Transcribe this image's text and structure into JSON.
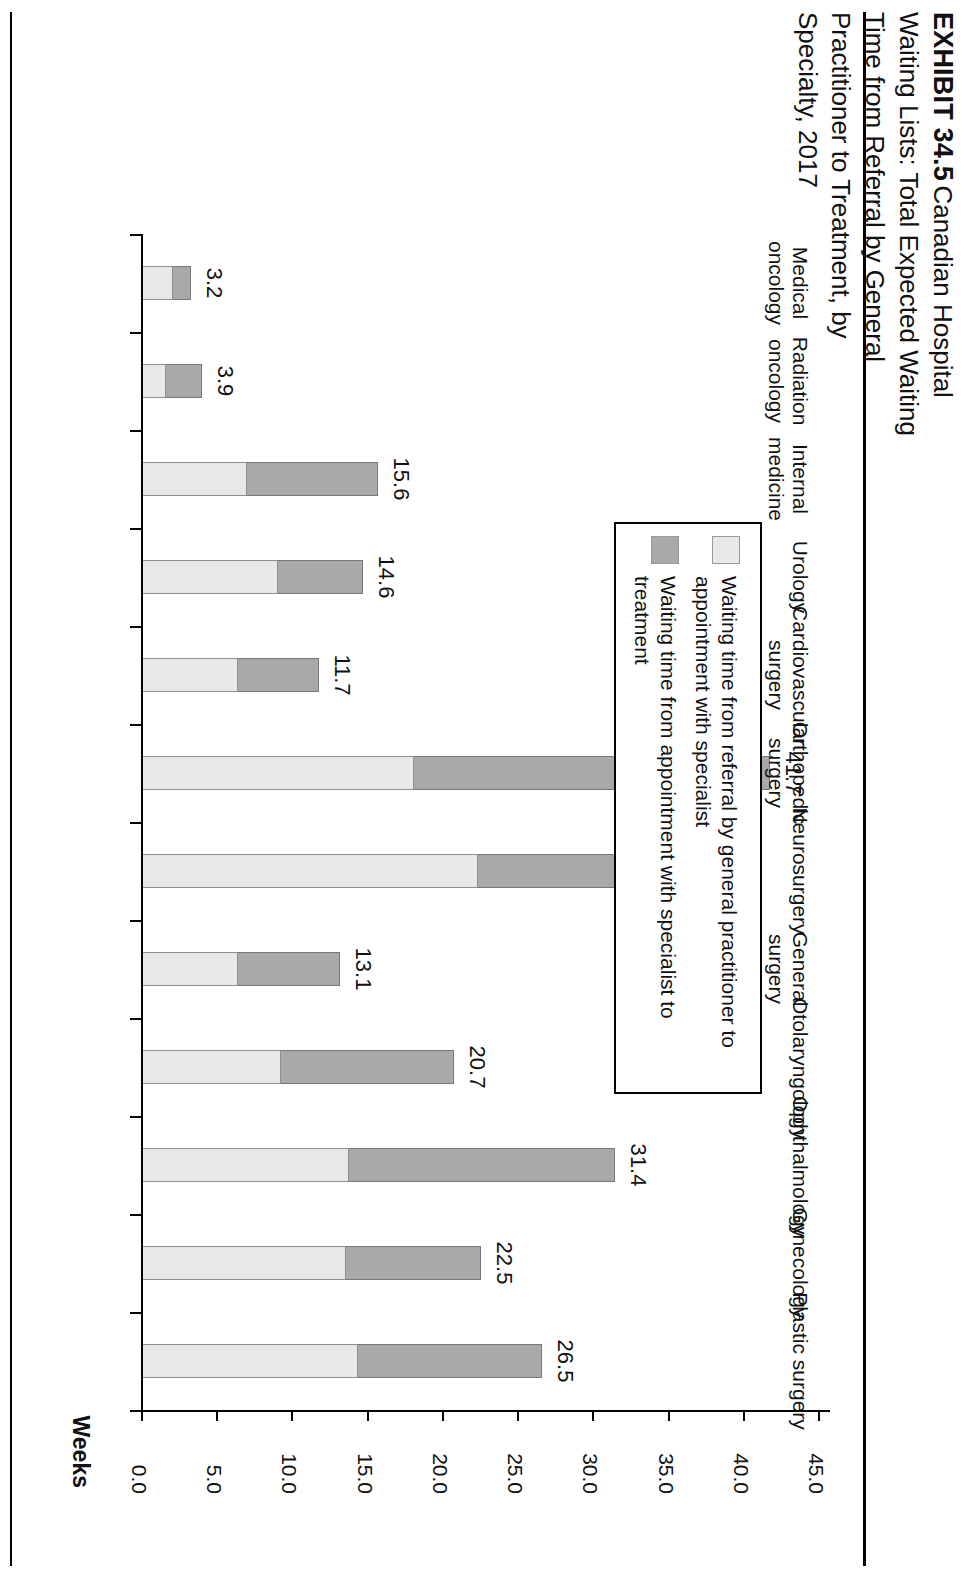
{
  "exhibit": {
    "number_label": "EXHIBIT 34.5",
    "title_lines": [
      "Canadian",
      "Hospital",
      "Waiting Lists:",
      "Total Expected",
      "Waiting Time",
      "from Referral",
      "by General",
      "Practitioner to",
      "Treatment, by",
      "Specialty, 2017"
    ],
    "title_full": "EXHIBIT 34.5 Canadian Hospital Waiting Lists: Total Expected Waiting Time from Referral by General Practitioner to Treatment, by Specialty, 2017"
  },
  "legend": {
    "position": "top-left",
    "items": [
      {
        "label": "Waiting time from referral by general practitioner to appointment with specialist",
        "color": "#e9e9e9",
        "swatch_name": "legend-swatch-gp-to-specialist"
      },
      {
        "label": "Waiting time from appointment with specialist to treatment",
        "color": "#a9a9a9",
        "swatch_name": "legend-swatch-specialist-to-treatment"
      }
    ]
  },
  "axis": {
    "value_axis_title": "Weeks",
    "tick_labels": [
      "0.0",
      "5.0",
      "10.0",
      "15.0",
      "20.0",
      "25.0",
      "30.0",
      "35.0",
      "40.0",
      "45.0"
    ],
    "tick_values": [
      0,
      5,
      10,
      15,
      20,
      25,
      30,
      35,
      40,
      45
    ],
    "min": 0,
    "max": 45
  },
  "chart_data": {
    "type": "bar",
    "orientation": "vertical-stacked",
    "title": "EXHIBIT 34.5 Canadian Hospital Waiting Lists: Total Expected Waiting Time from Referral by General Practitioner to Treatment, by Specialty, 2017",
    "xlabel": "",
    "ylabel": "Weeks",
    "ylim": [
      0,
      45
    ],
    "grid": false,
    "legend_position": "top-left",
    "categories": [
      "Medical oncology",
      "Radiation oncology",
      "Internal medicine",
      "Urology",
      "Cardiovascular surgery (elective)",
      "Orthopedic surgery",
      "Neurosurgery",
      "General surgery",
      "Otolaryngology",
      "Ophthalmology",
      "Gynecology",
      "Plastic surgery"
    ],
    "series": [
      {
        "name": "Waiting time from referral by general practitioner to appointment with specialist",
        "color": "#e9e9e9",
        "values": [
          2.0,
          1.5,
          6.9,
          9.0,
          6.3,
          18.0,
          22.3,
          6.3,
          9.2,
          13.7,
          13.5,
          14.3
        ]
      },
      {
        "name": "Waiting time from appointment with specialist to treatment",
        "color": "#a9a9a9",
        "values": [
          1.2,
          2.4,
          8.7,
          5.6,
          5.4,
          23.7,
          10.6,
          6.8,
          11.5,
          17.7,
          9.0,
          12.2
        ]
      }
    ],
    "totals": [
      3.2,
      3.9,
      15.6,
      14.6,
      11.7,
      41.7,
      32.9,
      13.1,
      20.7,
      31.4,
      22.5,
      26.5
    ],
    "total_labels": [
      "3.2",
      "3.9",
      "15.6",
      "14.6",
      "11.7",
      "41.7",
      "32.9",
      "13.1",
      "20.7",
      "31.4",
      "22.5",
      "26.5"
    ]
  },
  "colors": {
    "light_segment": "#e9e9e9",
    "dark_segment": "#a9a9a9",
    "bar_border": "#8e8e8e",
    "axis": "#000000",
    "text": "#111111",
    "background": "#ffffff"
  }
}
